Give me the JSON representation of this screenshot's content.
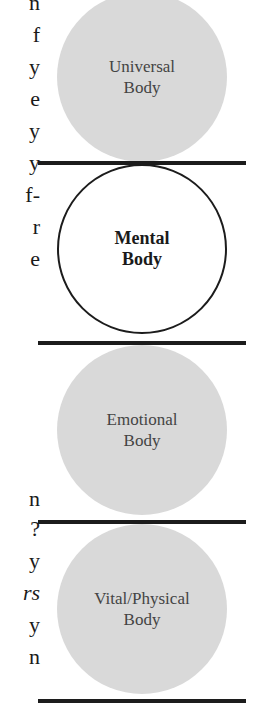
{
  "left_text_fragments": [
    {
      "text": "n",
      "italic": false
    },
    {
      "text": "f",
      "italic": false
    },
    {
      "text": "y",
      "italic": false
    },
    {
      "text": "e",
      "italic": false
    },
    {
      "text": "y",
      "italic": false
    },
    {
      "text": "y",
      "italic": false
    },
    {
      "text": "f-",
      "italic": false
    },
    {
      "text": "r",
      "italic": false
    },
    {
      "text": "e",
      "italic": false
    },
    {
      "text": "n",
      "italic": false
    },
    {
      "text": "?",
      "italic": false
    },
    {
      "text": "y",
      "italic": false
    },
    {
      "text": "rs",
      "italic": true
    },
    {
      "text": "y",
      "italic": false
    },
    {
      "text": "n",
      "italic": false
    }
  ],
  "diagram": {
    "bodies": [
      {
        "line1": "Universal",
        "line2": "Body",
        "style": "filled",
        "emphasis": false
      },
      {
        "line1": "Mental",
        "line2": "Body",
        "style": "outline",
        "emphasis": true
      },
      {
        "line1": "Emotional",
        "line2": "Body",
        "style": "filled",
        "emphasis": false
      },
      {
        "line1": "Vital/Physical",
        "line2": "Body",
        "style": "filled",
        "emphasis": false
      }
    ],
    "colors": {
      "fill": "#d9d9d9",
      "line": "#1c1c1c",
      "text": "#1a1a1a"
    }
  }
}
